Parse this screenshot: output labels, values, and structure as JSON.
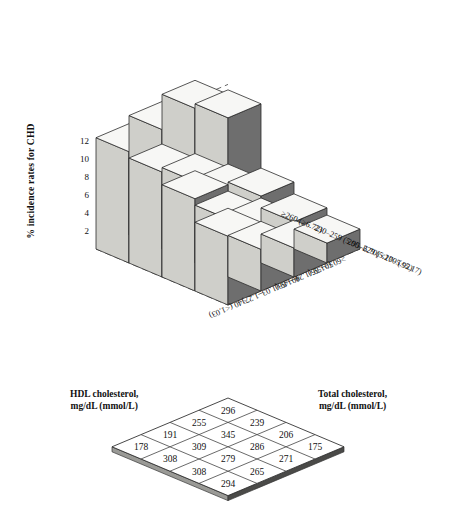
{
  "figure": {
    "y_axis": {
      "label": "% incidence rates for CHD",
      "ticks": [
        2,
        4,
        6,
        8,
        10,
        12
      ],
      "range": [
        0,
        14
      ]
    },
    "hdl_axis_title": "HDL cholesterol,\nmg/dL (mmol/L)",
    "hdl_axis_title_line1": "HDL cholesterol,",
    "hdl_axis_title_line2": "mg/dL (mmol/L)",
    "total_axis_title_line1": "Total  cholesterol,",
    "total_axis_title_line2": "mg/dL (mmol/L)"
  },
  "chart_data": {
    "type": "bar",
    "title": "",
    "xlabel": "HDL cholesterol, mg/dL (mmol/L)",
    "zlabel": "Total cholesterol, mg/dL (mmol/L)",
    "ylabel": "% incidence rates for CHD",
    "ylim": [
      0,
      14
    ],
    "yticks": [
      2,
      4,
      6,
      8,
      10,
      12
    ],
    "grid": true,
    "legend": "none",
    "hdl_categories": [
      "<40 (<1.03)",
      "40–49 (1.03–1.27)",
      "50–59 (1.29–1.53)",
      "≥60 (≥1.55)"
    ],
    "total_categories": [
      "<200 (<5.17)",
      "200–229 (5.17–5.92)",
      "230–259 (5.95–6.70)",
      "≥260 (≥6.72)"
    ],
    "series": [
      {
        "name": "<200 (<5.17)",
        "values": [
          7.6,
          4.6,
          3.2,
          2.2
        ]
      },
      {
        "name": "200–229 (5.17–5.92)",
        "values": [
          10.2,
          6.4,
          4.1,
          3.0
        ]
      },
      {
        "name": "230–259 (5.95–6.70)",
        "values": [
          11.6,
          9.0,
          6.3,
          4.3
        ]
      },
      {
        "name": "≥260 (≥6.72)",
        "values": [
          12.3,
          13.2,
          14.0,
          11.4
        ]
      }
    ],
    "counts_table": {
      "row_axis": "Total cholesterol, mg/dL (mmol/L)",
      "col_axis": "HDL cholesterol, mg/dL (mmol/L)",
      "rows": [
        [
          296,
          239,
          206,
          175
        ],
        [
          255,
          345,
          286,
          271
        ],
        [
          191,
          309,
          279,
          265
        ],
        [
          178,
          308,
          308,
          294
        ]
      ],
      "flat": [
        296,
        239,
        206,
        175,
        255,
        345,
        286,
        271,
        191,
        309,
        279,
        265,
        178,
        308,
        308,
        294
      ]
    }
  }
}
